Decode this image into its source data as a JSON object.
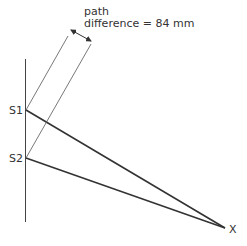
{
  "diagram": {
    "annotation": {
      "line1": "path",
      "line2": "difference = 84 mm"
    },
    "labels": {
      "source1": "S1",
      "source2": "S2",
      "point": "X"
    },
    "colors": {
      "line": "#333333",
      "background": "#ffffff"
    }
  }
}
